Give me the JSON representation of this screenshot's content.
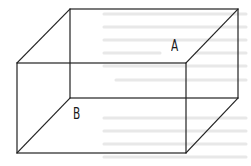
{
  "diagram": {
    "type": "wireframe-rectangular-box",
    "labels": {
      "a": "A",
      "b": "B"
    },
    "stroke_color": "#222222",
    "bleed_text_color": "#e4e4e4",
    "geometry": {
      "back_face": {
        "x1": 70,
        "y1": 9,
        "x2": 238,
        "y2": 98
      },
      "front_face": {
        "x1": 17,
        "y1": 63,
        "x2": 186,
        "y2": 153
      }
    }
  }
}
